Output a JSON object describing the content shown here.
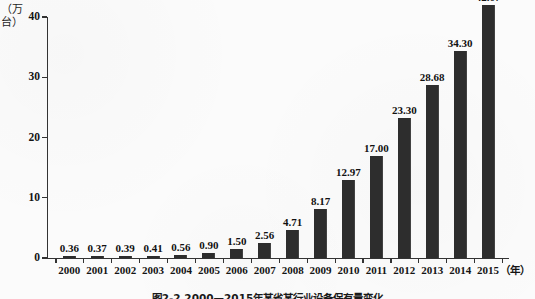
{
  "chart_data": {
    "type": "bar",
    "title": "",
    "caption": "图2-2  2000—2015年某省某行业设备保有量变化",
    "xlabel": "（年）",
    "ylabel": "（万台）",
    "ylim": [
      0,
      40
    ],
    "yticks": [
      0,
      10,
      20,
      30,
      40
    ],
    "ytick_labels": [
      "0",
      "10",
      "20",
      "30",
      "40"
    ],
    "grid": false,
    "legend": "none",
    "bar_color": "#2d2d2d",
    "categories": [
      "2000",
      "2001",
      "2002",
      "2003",
      "2004",
      "2005",
      "2006",
      "2007",
      "2008",
      "2009",
      "2010",
      "2011",
      "2012",
      "2013",
      "2014",
      "2015"
    ],
    "values": [
      0.36,
      0.37,
      0.39,
      0.41,
      0.56,
      0.9,
      1.5,
      2.56,
      4.71,
      8.17,
      12.97,
      17.0,
      23.3,
      28.68,
      34.3,
      42.07
    ],
    "value_labels": [
      "0.36",
      "0.37",
      "0.39",
      "0.41",
      "0.56",
      "0.90",
      "1.50",
      "2.56",
      "4.71",
      "8.17",
      "12.97",
      "17.00",
      "23.30",
      "28.68",
      "34.30",
      "42.07"
    ]
  }
}
